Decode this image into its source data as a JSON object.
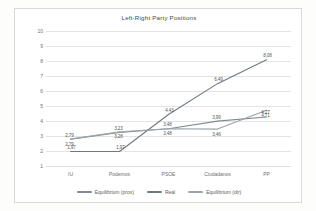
{
  "chart_data": {
    "type": "line",
    "title": "Left-Right Party Positions",
    "xlabel": "",
    "ylabel": "",
    "categories": [
      "IU",
      "Podemos",
      "PSOE",
      "Ciudadanos",
      "PP"
    ],
    "ylim": [
      1,
      10
    ],
    "yticks": [
      "10",
      "9",
      "8",
      "7",
      "6",
      "5",
      "4",
      "3",
      "2",
      "1"
    ],
    "grid": true,
    "legend_position": "bottom",
    "series": [
      {
        "name": "Equilibrium (prox)",
        "color": "#7e8c93",
        "values": [
          2.79,
          3.23,
          3.48,
          3.99,
          4.27
        ],
        "labels": [
          "2,79",
          "3,23",
          "3,48",
          "3,99",
          "4,27"
        ]
      },
      {
        "name": "Real",
        "color": "#6d7a80",
        "values": [
          1.97,
          1.97,
          4.43,
          6.49,
          8.08
        ],
        "labels": [
          "1,97",
          "1,97",
          "4,43",
          "6,49",
          "8,08"
        ]
      },
      {
        "name": "Equilibrium (dir)",
        "color": "#9aa4a9",
        "values": [
          2.79,
          3.28,
          3.48,
          3.46,
          4.71
        ],
        "labels": [
          "2,79",
          "3,28",
          "3,48",
          "3,46",
          "4,71"
        ]
      }
    ]
  }
}
